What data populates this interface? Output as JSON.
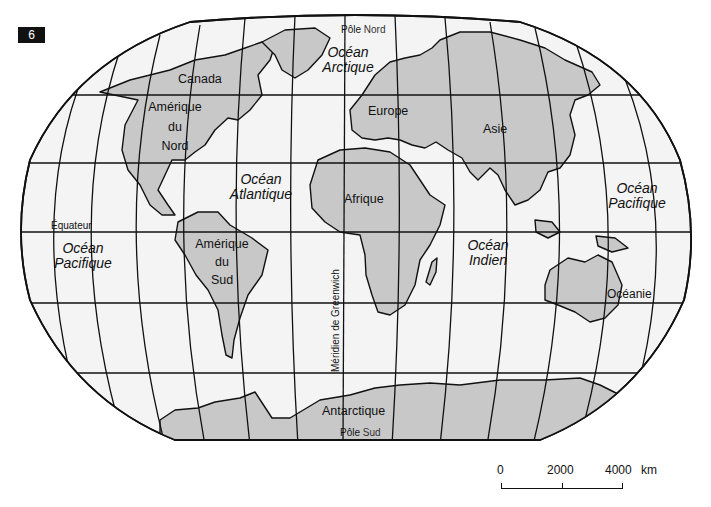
{
  "figure": {
    "number": "6"
  },
  "map": {
    "type": "world-map",
    "projection": "Robinson-like",
    "land_color": "#c8c8c8",
    "water_color": "#f4f4f4",
    "line_color": "#111111"
  },
  "labels": {
    "poles": {
      "north": {
        "prefix": "Pôle",
        "name": "Nord"
      },
      "south": {
        "prefix": "Pôle",
        "name": "Sud"
      }
    },
    "equator": "Équateur",
    "greenwich": "Méridien de Greenwich",
    "continents": {
      "canada": "Canada",
      "north_america": {
        "line1": "Amérique",
        "line2": "du",
        "line3": "Nord"
      },
      "south_america": {
        "line1": "Amérique",
        "line2": "du",
        "line3": "Sud"
      },
      "europe": "Europe",
      "asia": "Asie",
      "africa": "Afrique",
      "oceania": "Océanie",
      "antarctica": "Antarctique"
    },
    "oceans": {
      "arctic": {
        "line1": "Océan",
        "line2": "Arctique"
      },
      "atlantic": {
        "line1": "Océan",
        "line2": "Atlantique"
      },
      "indian": {
        "line1": "Océan",
        "line2": "Indien"
      },
      "pacific_west": {
        "line1": "Océan",
        "line2": "Pacifique"
      },
      "pacific_east": {
        "line1": "Océan",
        "line2": "Pacifique"
      }
    }
  },
  "scale_bar": {
    "ticks": [
      "0",
      "2000",
      "4000"
    ],
    "unit": "km"
  }
}
